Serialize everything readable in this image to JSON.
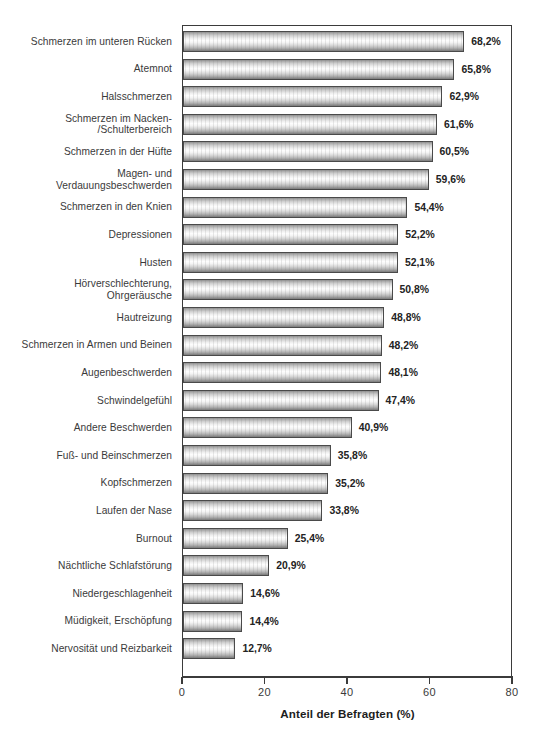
{
  "chart_data": {
    "type": "bar",
    "orientation": "horizontal",
    "title": "",
    "subtitle": "",
    "xlabel": "Anteil der Befragten (%)",
    "ylabel": "",
    "xlim": [
      0,
      80
    ],
    "xticks": [
      0,
      20,
      40,
      60,
      80
    ],
    "xtick_labels": [
      "0",
      "20",
      "40",
      "60",
      "80"
    ],
    "grid": false,
    "legend": null,
    "value_suffix": "%",
    "decimal_separator": ",",
    "categories": [
      "Schmerzen im unteren Rücken",
      "Atemnot",
      "Halsschmerzen",
      "Schmerzen im Nacken-\n/Schulterbereich",
      "Schmerzen in der Hüfte",
      "Magen- und\nVerdauungsbeschwerden",
      "Schmerzen in den Knien",
      "Depressionen",
      "Husten",
      "Hörverschlechterung,\nOhrgeräusche",
      "Hautreizung",
      "Schmerzen in Armen und Beinen",
      "Augenbeschwerden",
      "Schwindelgefühl",
      "Andere Beschwerden",
      "Fuß- und Beinschmerzen",
      "Kopfschmerzen",
      "Laufen der Nase",
      "Burnout",
      "Nächtliche Schlafstörung",
      "Niedergeschlagenheit",
      "Müdigkeit, Erschöpfung",
      "Nervosität und Reizbarkeit"
    ],
    "values": [
      68.2,
      65.8,
      62.9,
      61.6,
      60.5,
      59.6,
      54.4,
      52.2,
      52.1,
      50.8,
      48.8,
      48.2,
      48.1,
      47.4,
      40.9,
      35.8,
      35.2,
      33.8,
      25.4,
      20.9,
      14.6,
      14.4,
      12.7
    ],
    "value_labels": [
      "68,2%",
      "65,8%",
      "62,9%",
      "61,6%",
      "60,5%",
      "59,6%",
      "54,4%",
      "52,2%",
      "52,1%",
      "50,8%",
      "48,8%",
      "48,2%",
      "48,1%",
      "47,4%",
      "40,9%",
      "35,8%",
      "35,2%",
      "33,8%",
      "25,4%",
      "20,9%",
      "14,6%",
      "14,4%",
      "12,7%"
    ],
    "colors": {
      "bar_fill_light": "#fdfdfd",
      "bar_fill_dark": "#8c8c8c",
      "bar_border": "#4a4a4a",
      "axis": "#3b3b3b",
      "text": "#3a3a3a",
      "value_text": "#232323",
      "background": "#ffffff"
    }
  }
}
